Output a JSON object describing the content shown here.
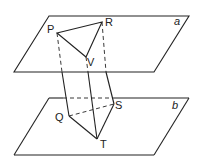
{
  "diagram": {
    "planes": [
      {
        "name": "a",
        "label": "a",
        "points": [
          [
            49,
            16
          ],
          [
            189,
            16
          ],
          [
            154,
            72
          ],
          [
            14,
            72
          ]
        ],
        "label_pos": [
          176,
          25
        ]
      },
      {
        "name": "b",
        "label": "b",
        "points": [
          [
            49,
            98
          ],
          [
            189,
            98
          ],
          [
            154,
            155
          ],
          [
            14,
            155
          ]
        ],
        "label_pos": [
          174,
          109
        ]
      }
    ],
    "points": {
      "P": {
        "label": "P",
        "xy": [
          57,
          33
        ],
        "label_pos": [
          48,
          33
        ]
      },
      "R": {
        "label": "R",
        "xy": [
          102,
          22
        ],
        "label_pos": [
          106,
          24
        ]
      },
      "V": {
        "label": "V",
        "xy": [
          86,
          57
        ],
        "label_pos": [
          88,
          66
        ]
      },
      "Q": {
        "label": "Q",
        "xy": [
          69,
          116
        ],
        "label_pos": [
          56,
          120
        ]
      },
      "S": {
        "label": "S",
        "xy": [
          114,
          104
        ],
        "label_pos": [
          115,
          107
        ]
      },
      "T": {
        "label": "T",
        "xy": [
          97,
          139
        ],
        "label_pos": [
          101,
          148
        ]
      }
    },
    "segments": {
      "solid": [
        [
          "P",
          "R"
        ],
        [
          "R",
          "V"
        ],
        [
          "V",
          "P"
        ],
        [
          "Q",
          "T"
        ],
        [
          "T",
          "S"
        ]
      ],
      "dashed": [
        [
          "Q",
          "S"
        ]
      ]
    }
  }
}
